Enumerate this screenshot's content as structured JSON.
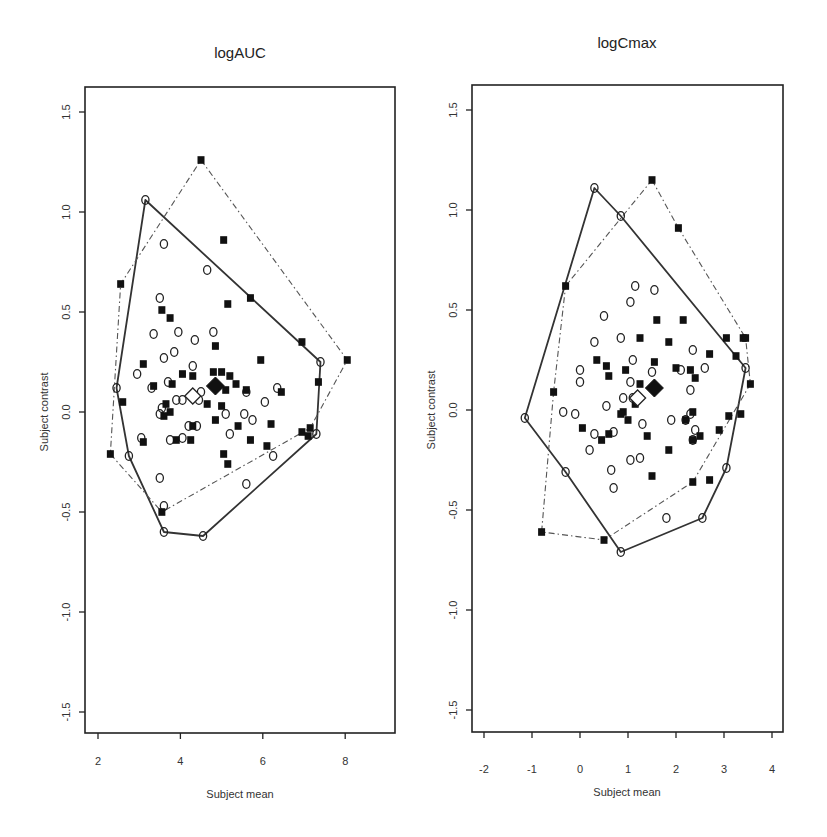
{
  "header_fragment": "",
  "chart_data": [
    {
      "type": "scatter",
      "title": "logAUC",
      "xlabel": "Subject mean",
      "ylabel": "Subject contrast",
      "xlim": [
        1.7,
        9.2
      ],
      "ylim": [
        -1.6,
        1.63
      ],
      "xticks": [
        2,
        4,
        6,
        8
      ],
      "xtick_labels": [
        "2",
        "4",
        "6",
        "8"
      ],
      "yticks": [
        1.5,
        1.0,
        0.5,
        0.0,
        -0.5,
        -1.0,
        -1.5
      ],
      "ytick_labels": [
        "1.5",
        "1.0",
        "0.5",
        "0.0",
        "-0.5",
        "-1.0",
        "-1.5"
      ],
      "grid": false,
      "legend": null,
      "note": "Point coordinates are approximate visual estimates; hull vertices and means are more reliable.",
      "series": [
        {
          "name": "open-circles",
          "marker": "open-circle",
          "hull_style": "solid",
          "hull": [
            [
              3.15,
              1.06
            ],
            [
              7.4,
              0.25
            ],
            [
              7.3,
              -0.11
            ],
            [
              4.55,
              -0.62
            ],
            [
              3.6,
              -0.6
            ],
            [
              2.75,
              -0.22
            ],
            [
              2.45,
              0.12
            ]
          ],
          "points": [
            [
              3.6,
              0.84
            ],
            [
              4.65,
              0.71
            ],
            [
              3.5,
              0.57
            ],
            [
              3.35,
              0.39
            ],
            [
              3.95,
              0.4
            ],
            [
              4.8,
              0.4
            ],
            [
              4.35,
              0.36
            ],
            [
              3.6,
              0.27
            ],
            [
              3.85,
              0.3
            ],
            [
              4.3,
              0.23
            ],
            [
              2.95,
              0.19
            ],
            [
              3.3,
              0.12
            ],
            [
              3.7,
              0.15
            ],
            [
              4.5,
              0.1
            ],
            [
              3.9,
              0.06
            ],
            [
              4.05,
              0.06
            ],
            [
              3.55,
              0.02
            ],
            [
              3.5,
              -0.01
            ],
            [
              4.45,
              0.06
            ],
            [
              5.1,
              -0.01
            ],
            [
              5.6,
              0.1
            ],
            [
              6.35,
              0.12
            ],
            [
              6.05,
              0.05
            ],
            [
              5.55,
              -0.01
            ],
            [
              5.75,
              -0.04
            ],
            [
              4.4,
              -0.07
            ],
            [
              4.2,
              -0.07
            ],
            [
              4.05,
              -0.13
            ],
            [
              3.75,
              -0.14
            ],
            [
              3.05,
              -0.13
            ],
            [
              5.2,
              -0.11
            ],
            [
              3.5,
              -0.33
            ],
            [
              5.6,
              -0.36
            ],
            [
              6.25,
              -0.22
            ],
            [
              3.6,
              -0.47
            ]
          ]
        },
        {
          "name": "filled-squares",
          "marker": "filled-square",
          "hull_style": "dash-dot",
          "hull": [
            [
              4.5,
              1.26
            ],
            [
              8.05,
              0.26
            ],
            [
              7.15,
              -0.08
            ],
            [
              3.55,
              -0.5
            ],
            [
              2.3,
              -0.21
            ],
            [
              2.55,
              0.64
            ]
          ],
          "points": [
            [
              5.05,
              0.86
            ],
            [
              3.55,
              0.51
            ],
            [
              3.75,
              0.47
            ],
            [
              5.15,
              0.54
            ],
            [
              5.7,
              0.57
            ],
            [
              6.95,
              0.35
            ],
            [
              4.85,
              0.33
            ],
            [
              5.95,
              0.26
            ],
            [
              3.1,
              0.24
            ],
            [
              3.35,
              0.13
            ],
            [
              4.05,
              0.19
            ],
            [
              4.8,
              0.2
            ],
            [
              5.0,
              0.2
            ],
            [
              5.2,
              0.18
            ],
            [
              5.35,
              0.14
            ],
            [
              7.35,
              0.15
            ],
            [
              4.3,
              0.18
            ],
            [
              3.8,
              0.14
            ],
            [
              5.1,
              0.11
            ],
            [
              5.6,
              0.11
            ],
            [
              6.45,
              0.1
            ],
            [
              3.65,
              0.04
            ],
            [
              3.75,
              0.0
            ],
            [
              3.6,
              -0.02
            ],
            [
              4.65,
              0.04
            ],
            [
              5.0,
              0.03
            ],
            [
              4.3,
              -0.07
            ],
            [
              5.4,
              -0.07
            ],
            [
              6.2,
              -0.06
            ],
            [
              4.85,
              -0.04
            ],
            [
              3.9,
              -0.14
            ],
            [
              4.25,
              -0.14
            ],
            [
              5.7,
              -0.14
            ],
            [
              5.05,
              -0.21
            ],
            [
              6.1,
              -0.17
            ],
            [
              6.95,
              -0.1
            ],
            [
              5.15,
              -0.26
            ],
            [
              2.6,
              0.05
            ],
            [
              7.1,
              -0.12
            ],
            [
              3.1,
              -0.15
            ]
          ]
        },
        {
          "name": "means",
          "open_diamond": [
            4.3,
            0.08
          ],
          "filled_diamond": [
            4.85,
            0.13
          ]
        }
      ]
    },
    {
      "type": "scatter",
      "title": "logCmax",
      "xlabel": "Subject mean",
      "ylabel": "Subject contrast",
      "xlim": [
        -2.25,
        4.25
      ],
      "ylim": [
        -1.61,
        1.62
      ],
      "xticks": [
        -2,
        -1,
        0,
        1,
        2,
        3,
        4
      ],
      "xtick_labels": [
        "-2",
        "-1",
        "0",
        "1",
        "2",
        "3",
        "4"
      ],
      "yticks": [
        1.5,
        1.0,
        0.5,
        0.0,
        -0.5,
        -1.0,
        -1.5
      ],
      "ytick_labels": [
        "1.5",
        "1.0",
        "0.5",
        "0.0",
        "-0.5",
        "-1.0",
        "-1.5"
      ],
      "grid": false,
      "legend": null,
      "note": "Point coordinates are approximate visual estimates; hull vertices and means are more reliable.",
      "series": [
        {
          "name": "open-circles",
          "marker": "open-circle",
          "hull_style": "solid",
          "hull": [
            [
              0.3,
              1.11
            ],
            [
              0.85,
              0.97
            ],
            [
              3.45,
              0.21
            ],
            [
              3.05,
              -0.29
            ],
            [
              2.55,
              -0.54
            ],
            [
              0.85,
              -0.71
            ],
            [
              -0.3,
              -0.31
            ],
            [
              -1.15,
              -0.04
            ]
          ],
          "points": [
            [
              1.15,
              0.62
            ],
            [
              1.55,
              0.6
            ],
            [
              1.05,
              0.54
            ],
            [
              0.5,
              0.47
            ],
            [
              0.3,
              0.34
            ],
            [
              0.85,
              0.36
            ],
            [
              2.35,
              0.3
            ],
            [
              0.0,
              0.2
            ],
            [
              1.1,
              0.25
            ],
            [
              1.5,
              0.19
            ],
            [
              2.1,
              0.2
            ],
            [
              2.6,
              0.21
            ],
            [
              1.05,
              0.14
            ],
            [
              0.9,
              0.06
            ],
            [
              1.1,
              0.06
            ],
            [
              2.3,
              0.1
            ],
            [
              0.0,
              0.14
            ],
            [
              -0.1,
              -0.02
            ],
            [
              -0.35,
              -0.01
            ],
            [
              0.55,
              0.02
            ],
            [
              1.9,
              -0.05
            ],
            [
              2.2,
              -0.05
            ],
            [
              2.3,
              -0.02
            ],
            [
              1.3,
              -0.07
            ],
            [
              0.7,
              -0.11
            ],
            [
              0.3,
              -0.12
            ],
            [
              2.4,
              -0.1
            ],
            [
              2.35,
              -0.15
            ],
            [
              0.2,
              -0.2
            ],
            [
              1.25,
              -0.24
            ],
            [
              1.05,
              -0.25
            ],
            [
              0.65,
              -0.3
            ],
            [
              0.7,
              -0.39
            ],
            [
              1.8,
              -0.54
            ]
          ]
        },
        {
          "name": "filled-squares",
          "marker": "filled-square",
          "hull_style": "dash-dot",
          "hull": [
            [
              1.5,
              1.15
            ],
            [
              2.05,
              0.91
            ],
            [
              3.45,
              0.36
            ],
            [
              3.55,
              0.13
            ],
            [
              2.35,
              -0.36
            ],
            [
              0.5,
              -0.65
            ],
            [
              -0.8,
              -0.61
            ],
            [
              -0.55,
              0.09
            ],
            [
              -0.3,
              0.62
            ]
          ],
          "points": [
            [
              1.6,
              0.45
            ],
            [
              2.15,
              0.45
            ],
            [
              1.25,
              0.36
            ],
            [
              1.85,
              0.34
            ],
            [
              3.05,
              0.36
            ],
            [
              3.4,
              0.36
            ],
            [
              0.35,
              0.25
            ],
            [
              0.55,
              0.22
            ],
            [
              2.7,
              0.28
            ],
            [
              3.25,
              0.27
            ],
            [
              0.95,
              0.2
            ],
            [
              1.55,
              0.24
            ],
            [
              2.0,
              0.21
            ],
            [
              2.3,
              0.2
            ],
            [
              0.6,
              0.17
            ],
            [
              1.25,
              0.13
            ],
            [
              2.4,
              0.16
            ],
            [
              1.15,
              0.03
            ],
            [
              0.9,
              -0.01
            ],
            [
              1.0,
              -0.05
            ],
            [
              0.85,
              -0.02
            ],
            [
              2.2,
              -0.05
            ],
            [
              2.35,
              -0.01
            ],
            [
              3.35,
              -0.02
            ],
            [
              0.05,
              -0.09
            ],
            [
              0.6,
              -0.12
            ],
            [
              1.4,
              -0.13
            ],
            [
              2.35,
              -0.15
            ],
            [
              2.5,
              -0.13
            ],
            [
              2.9,
              -0.1
            ],
            [
              0.45,
              -0.15
            ],
            [
              1.85,
              -0.2
            ],
            [
              1.5,
              -0.33
            ],
            [
              2.7,
              -0.35
            ],
            [
              3.1,
              -0.03
            ]
          ]
        },
        {
          "name": "means",
          "open_diamond": [
            1.2,
            0.06
          ],
          "filled_diamond": [
            1.55,
            0.11
          ]
        }
      ]
    }
  ],
  "panels": {
    "left": {
      "title": "logAUC",
      "xlabel": "Subject mean",
      "ylabel": "Subject contrast"
    },
    "right": {
      "title": "logCmax",
      "xlabel": "Subject mean",
      "ylabel": "Subject contrast"
    }
  }
}
